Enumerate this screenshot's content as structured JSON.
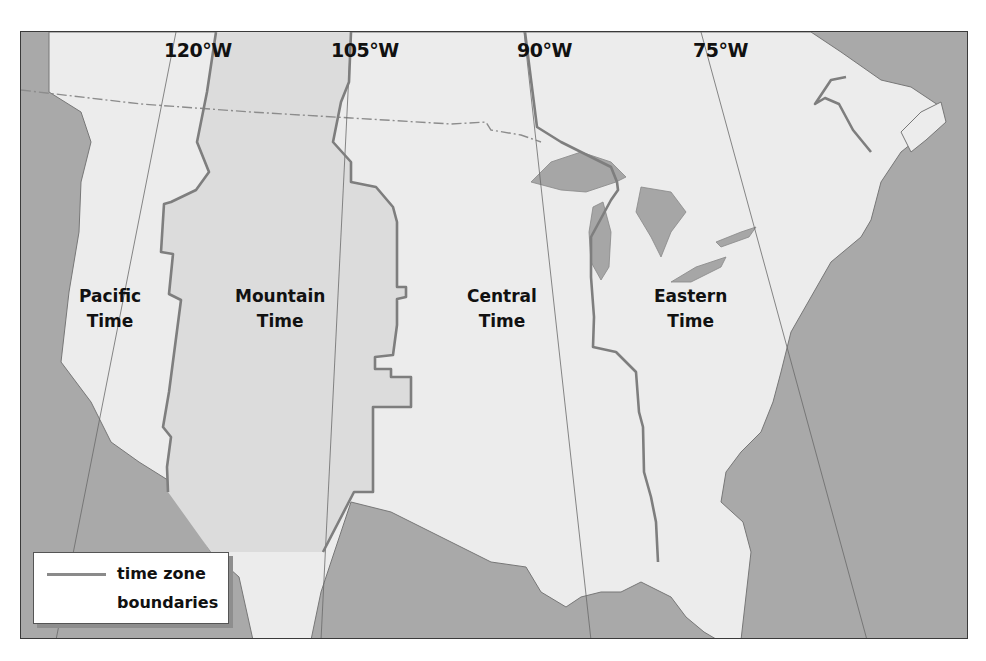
{
  "map": {
    "title": "",
    "frame": {
      "x": 20,
      "y": 31,
      "width": 948,
      "height": 608
    },
    "colors": {
      "water": "#a9a9a9",
      "land": "#ececec",
      "mountain_zone": "#dcdcdc",
      "boundary": "#7e7e7e",
      "state_line": "#8c8c8c",
      "meridian_line": "#6a6a6a",
      "label_text": "#111111"
    },
    "meridians": [
      {
        "label": "120°W",
        "x": 143,
        "y": 9,
        "line": [
          [
            155,
            0
          ],
          [
            35,
            608
          ]
        ]
      },
      {
        "label": "105°W",
        "x": 310,
        "y": 9,
        "line": [
          [
            330,
            0
          ],
          [
            300,
            608
          ]
        ]
      },
      {
        "label": "90°W",
        "x": 496,
        "y": 9,
        "line": [
          [
            503,
            0
          ],
          [
            570,
            608
          ]
        ]
      },
      {
        "label": "75°W",
        "x": 672,
        "y": 9,
        "line": [
          [
            680,
            0
          ],
          [
            846,
            608
          ]
        ]
      }
    ],
    "zones": [
      {
        "id": "pacific",
        "line1": "Pacific",
        "line2": "Time",
        "x": 58,
        "y": 252
      },
      {
        "id": "mountain",
        "line1": "Mountain",
        "line2": "Time",
        "x": 214,
        "y": 252
      },
      {
        "id": "central",
        "line1": "Central",
        "line2": "Time",
        "x": 446,
        "y": 252
      },
      {
        "id": "eastern",
        "line1": "Eastern",
        "line2": "Time",
        "x": 633,
        "y": 252
      }
    ],
    "timezone_boundaries": [
      {
        "name": "pacific-mountain",
        "points": [
          [
            195,
            0
          ],
          [
            186,
            60
          ],
          [
            176,
            110
          ],
          [
            188,
            140
          ],
          [
            175,
            158
          ],
          [
            150,
            170
          ],
          [
            143,
            172
          ],
          [
            140,
            220
          ],
          [
            152,
            222
          ],
          [
            148,
            262
          ],
          [
            160,
            268
          ],
          [
            148,
            360
          ],
          [
            142,
            395
          ],
          [
            150,
            405
          ],
          [
            146,
            435
          ],
          [
            147,
            460
          ]
        ]
      },
      {
        "name": "mountain-central",
        "points": [
          [
            330,
            0
          ],
          [
            328,
            50
          ],
          [
            320,
            70
          ],
          [
            312,
            110
          ],
          [
            330,
            130
          ],
          [
            330,
            150
          ],
          [
            355,
            155
          ],
          [
            372,
            175
          ],
          [
            376,
            190
          ],
          [
            376,
            255
          ],
          [
            385,
            255
          ],
          [
            385,
            265
          ],
          [
            376,
            267
          ],
          [
            376,
            293
          ],
          [
            372,
            323
          ],
          [
            354,
            325
          ],
          [
            354,
            337
          ],
          [
            370,
            337
          ],
          [
            370,
            345
          ],
          [
            390,
            345
          ],
          [
            390,
            375
          ],
          [
            355,
            375
          ],
          [
            352,
            375
          ],
          [
            352,
            460
          ],
          [
            333,
            460
          ],
          [
            302,
            520
          ]
        ]
      },
      {
        "name": "central-eastern",
        "points": [
          [
            504,
            0
          ],
          [
            516,
            95
          ],
          [
            540,
            110
          ],
          [
            590,
            135
          ],
          [
            596,
            150
          ],
          [
            597,
            158
          ],
          [
            590,
            168
          ],
          [
            570,
            205
          ],
          [
            570,
            245
          ],
          [
            573,
            285
          ],
          [
            572,
            315
          ],
          [
            595,
            320
          ],
          [
            615,
            340
          ],
          [
            618,
            380
          ],
          [
            622,
            395
          ],
          [
            623,
            440
          ],
          [
            630,
            465
          ],
          [
            635,
            490
          ],
          [
            637,
            530
          ]
        ]
      },
      {
        "name": "atlantic-quebec",
        "points": [
          [
            825,
            45
          ],
          [
            810,
            48
          ],
          [
            794,
            72
          ],
          [
            804,
            66
          ],
          [
            818,
            72
          ],
          [
            832,
            98
          ],
          [
            850,
            120
          ]
        ]
      }
    ],
    "us_canada_border": [
      [
        0,
        58
      ],
      [
        120,
        72
      ],
      [
        230,
        80
      ],
      [
        330,
        86
      ],
      [
        430,
        92
      ],
      [
        465,
        90
      ],
      [
        470,
        98
      ],
      [
        500,
        103
      ],
      [
        520,
        110
      ]
    ],
    "land_regions": [
      {
        "name": "north-america",
        "points": [
          [
            28,
            0
          ],
          [
            28,
            60
          ],
          [
            60,
            80
          ],
          [
            70,
            110
          ],
          [
            60,
            150
          ],
          [
            58,
            200
          ],
          [
            48,
            260
          ],
          [
            40,
            330
          ],
          [
            70,
            370
          ],
          [
            90,
            410
          ],
          [
            118,
            430
          ],
          [
            150,
            450
          ],
          [
            165,
            480
          ],
          [
            190,
            520
          ],
          [
            218,
            545
          ],
          [
            232,
            608
          ],
          [
            290,
            608
          ],
          [
            300,
            560
          ],
          [
            330,
            470
          ],
          [
            370,
            480
          ],
          [
            420,
            505
          ],
          [
            470,
            530
          ],
          [
            505,
            535
          ],
          [
            520,
            560
          ],
          [
            545,
            575
          ],
          [
            560,
            565
          ],
          [
            580,
            560
          ],
          [
            600,
            560
          ],
          [
            620,
            550
          ],
          [
            650,
            565
          ],
          [
            665,
            585
          ],
          [
            683,
            600
          ],
          [
            700,
            610
          ],
          [
            720,
            608
          ],
          [
            730,
            520
          ],
          [
            722,
            490
          ],
          [
            700,
            470
          ],
          [
            705,
            440
          ],
          [
            720,
            420
          ],
          [
            740,
            400
          ],
          [
            752,
            370
          ],
          [
            760,
            340
          ],
          [
            770,
            300
          ],
          [
            790,
            265
          ],
          [
            810,
            230
          ],
          [
            840,
            205
          ],
          [
            850,
            188
          ],
          [
            860,
            150
          ],
          [
            880,
            120
          ],
          [
            905,
            100
          ],
          [
            920,
            75
          ],
          [
            890,
            55
          ],
          [
            860,
            48
          ],
          [
            820,
            20
          ],
          [
            790,
            0
          ]
        ]
      },
      {
        "name": "newfoundland-cape",
        "points": [
          [
            880,
            100
          ],
          [
            900,
            80
          ],
          [
            920,
            70
          ],
          [
            925,
            90
          ],
          [
            905,
            108
          ],
          [
            890,
            120
          ]
        ]
      }
    ],
    "great_lakes": [
      {
        "name": "lake-superior",
        "points": [
          [
            510,
            150
          ],
          [
            530,
            130
          ],
          [
            560,
            120
          ],
          [
            590,
            130
          ],
          [
            605,
            145
          ],
          [
            595,
            150
          ],
          [
            565,
            160
          ],
          [
            540,
            158
          ]
        ]
      },
      {
        "name": "lake-michigan",
        "points": [
          [
            572,
            175
          ],
          [
            582,
            170
          ],
          [
            590,
            200
          ],
          [
            588,
            235
          ],
          [
            580,
            248
          ],
          [
            570,
            230
          ],
          [
            568,
            200
          ]
        ]
      },
      {
        "name": "lake-huron",
        "points": [
          [
            620,
            155
          ],
          [
            650,
            160
          ],
          [
            665,
            180
          ],
          [
            650,
            200
          ],
          [
            640,
            225
          ],
          [
            630,
            205
          ],
          [
            615,
            180
          ]
        ]
      },
      {
        "name": "lake-erie",
        "points": [
          [
            650,
            250
          ],
          [
            675,
            235
          ],
          [
            705,
            225
          ],
          [
            700,
            235
          ],
          [
            670,
            250
          ]
        ]
      },
      {
        "name": "lake-ontario",
        "points": [
          [
            695,
            210
          ],
          [
            720,
            200
          ],
          [
            735,
            195
          ],
          [
            728,
            205
          ],
          [
            700,
            215
          ]
        ]
      }
    ],
    "legend": {
      "line_color": "#8a8a8a",
      "label_line1": "time zone",
      "label_line2": "boundaries"
    }
  }
}
